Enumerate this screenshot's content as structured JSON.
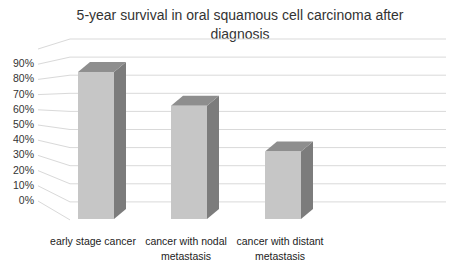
{
  "chart_data": {
    "type": "bar",
    "title": "5-year survival in oral squamous cell carcinoma after diagnosis",
    "categories": [
      "early stage cancer",
      "cancer with nodal metastasis",
      "cancer with distant metastasis"
    ],
    "values": [
      87,
      67,
      40
    ],
    "value_unit": "%",
    "xlabel": "",
    "ylabel": "",
    "ylim": [
      0,
      100
    ],
    "yticks": [
      "0%",
      "10%",
      "20%",
      "30%",
      "40%",
      "50%",
      "60%",
      "70%",
      "80%",
      "90%"
    ],
    "grid": true,
    "legend": null,
    "style": "3d-column",
    "colors": {
      "front": "#c6c6c6",
      "side": "#7c7c7c",
      "top": "#8e8e8e",
      "grid": "#d9d9d9"
    }
  },
  "labels": {
    "title": "5-year survival in oral squamous cell carcinoma after diagnosis",
    "cat0_line1": "early stage cancer",
    "cat0_line2": "",
    "cat1_line1": "cancer with nodal",
    "cat1_line2": "metastasis",
    "cat2_line1": "cancer with distant",
    "cat2_line2": "metastasis"
  }
}
